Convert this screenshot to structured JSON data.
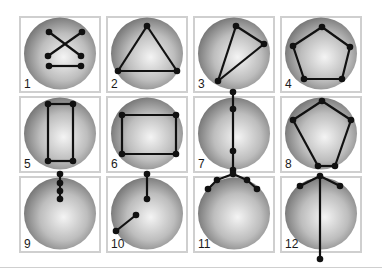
{
  "figure": {
    "type": "numbered grid of sphere graph diagrams",
    "columns": 4,
    "rows": 3,
    "panels": [
      {
        "label": "1",
        "description": "X with center line",
        "nodes": [
          [
            30,
            16
          ],
          [
            63,
            16
          ],
          [
            30,
            50
          ],
          [
            62,
            50
          ],
          [
            29,
            40
          ],
          [
            62,
            40
          ]
        ],
        "edges": [
          [
            0,
            5
          ],
          [
            1,
            4
          ],
          [
            2,
            3
          ]
        ]
      },
      {
        "label": "2",
        "description": "triangle",
        "nodes": [
          [
            41,
            10
          ],
          [
            12,
            55
          ],
          [
            71,
            55
          ]
        ],
        "edges": [
          [
            0,
            1
          ],
          [
            1,
            2
          ],
          [
            2,
            0
          ]
        ]
      },
      {
        "label": "3",
        "description": "skewed triangle",
        "nodes": [
          [
            43,
            10
          ],
          [
            71,
            28
          ],
          [
            25,
            65
          ]
        ],
        "edges": [
          [
            0,
            1
          ],
          [
            1,
            2
          ],
          [
            2,
            0
          ]
        ]
      },
      {
        "label": "4",
        "description": "pentagon",
        "nodes": [
          [
            42,
            11
          ],
          [
            70,
            31
          ],
          [
            62,
            63
          ],
          [
            24,
            63
          ],
          [
            13,
            30
          ]
        ],
        "edges": [
          [
            0,
            1
          ],
          [
            1,
            2
          ],
          [
            2,
            3
          ],
          [
            3,
            4
          ],
          [
            4,
            0
          ]
        ]
      },
      {
        "label": "5",
        "description": "tall rectangle",
        "nodes": [
          [
            29,
            8
          ],
          [
            54,
            8
          ],
          [
            29,
            65
          ],
          [
            54,
            65
          ]
        ],
        "edges": [
          [
            0,
            1
          ],
          [
            1,
            3
          ],
          [
            3,
            2
          ],
          [
            2,
            0
          ]
        ]
      },
      {
        "label": "6",
        "description": "wide rectangle",
        "nodes": [
          [
            16,
            19
          ],
          [
            70,
            19
          ],
          [
            16,
            58
          ],
          [
            70,
            58
          ]
        ],
        "edges": [
          [
            0,
            1
          ],
          [
            1,
            3
          ],
          [
            3,
            2
          ],
          [
            2,
            0
          ]
        ]
      },
      {
        "label": "7",
        "description": "vertical chain of four",
        "nodes": [
          [
            40,
            -4
          ],
          [
            40,
            13
          ],
          [
            40,
            55
          ],
          [
            40,
            74
          ]
        ],
        "edges": [
          [
            0,
            1
          ],
          [
            1,
            2
          ],
          [
            2,
            3
          ]
        ]
      },
      {
        "label": "8",
        "description": "irregular pentagon",
        "nodes": [
          [
            42,
            5
          ],
          [
            71,
            24
          ],
          [
            55,
            70
          ],
          [
            38,
            70
          ],
          [
            13,
            24
          ]
        ],
        "edges": [
          [
            0,
            1
          ],
          [
            1,
            2
          ],
          [
            2,
            3
          ],
          [
            3,
            4
          ],
          [
            4,
            0
          ]
        ]
      },
      {
        "label": "9",
        "description": "short vertical chain of four",
        "nodes": [
          [
            41,
            -2
          ],
          [
            41,
            7
          ],
          [
            41,
            15
          ],
          [
            41,
            23
          ]
        ],
        "edges": [
          [
            0,
            1
          ],
          [
            1,
            2
          ],
          [
            2,
            3
          ]
        ]
      },
      {
        "label": "10",
        "description": "two separate segments",
        "nodes": [
          [
            41,
            -2
          ],
          [
            41,
            23
          ],
          [
            30,
            39
          ],
          [
            10,
            55
          ]
        ],
        "edges": [
          [
            0,
            1
          ],
          [
            2,
            3
          ]
        ]
      },
      {
        "label": "11",
        "description": "arc chain of five",
        "nodes": [
          [
            40,
            -2
          ],
          [
            24,
            4
          ],
          [
            15,
            13
          ],
          [
            54,
            4
          ],
          [
            64,
            13
          ]
        ],
        "edges": [
          [
            1,
            0
          ],
          [
            0,
            3
          ],
          [
            3,
            4
          ],
          [
            1,
            2
          ]
        ]
      },
      {
        "label": "12",
        "description": "T shape with long stem",
        "nodes": [
          [
            40,
            0
          ],
          [
            20,
            10
          ],
          [
            60,
            10
          ],
          [
            40,
            83
          ]
        ],
        "edges": [
          [
            1,
            0
          ],
          [
            0,
            2
          ],
          [
            0,
            3
          ]
        ]
      }
    ]
  },
  "colors": {
    "panel_border": "#cfcfcf",
    "line": "#111111",
    "node": "#111111",
    "sphere_light": "#f4f4f4",
    "sphere_dark": "#6e6e6e"
  }
}
